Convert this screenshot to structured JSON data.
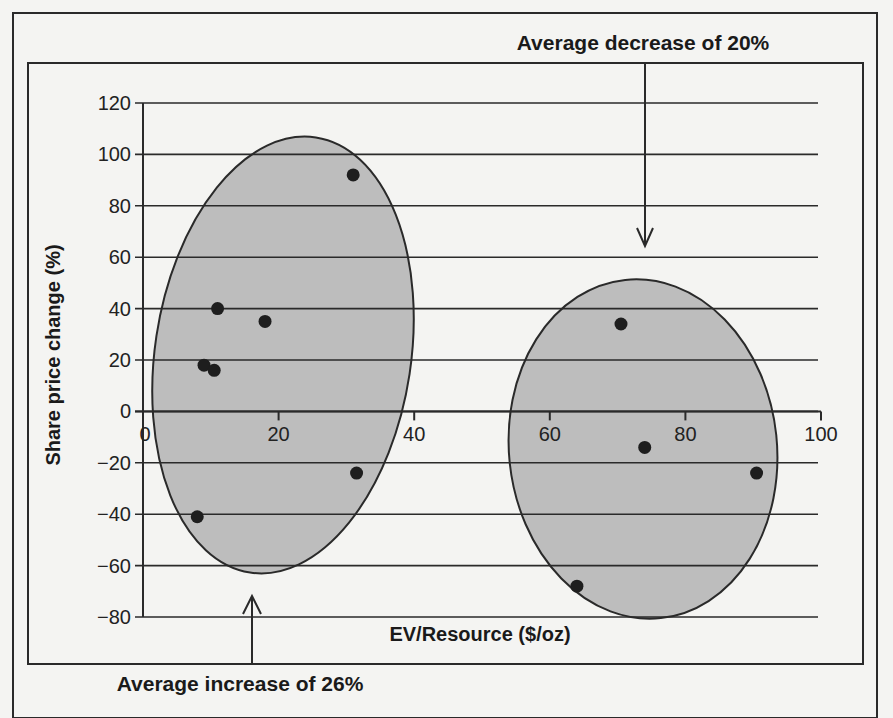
{
  "chart_data": {
    "type": "scatter",
    "title": "",
    "xlabel": "EV/Resource ($/oz)",
    "ylabel": "Share price change (%)",
    "xlim": [
      0,
      100
    ],
    "ylim": [
      -80,
      120
    ],
    "x_ticks": [
      0,
      20,
      40,
      60,
      80,
      100
    ],
    "y_ticks": [
      120,
      100,
      80,
      60,
      40,
      20,
      0,
      -20,
      -40,
      -60,
      -80
    ],
    "x_tick_labels": [
      "0",
      "20",
      "40",
      "60",
      "80",
      "100"
    ],
    "y_tick_labels": [
      "120",
      "100",
      "80",
      "60",
      "40",
      "20",
      "0",
      "−20",
      "−40",
      "−60",
      "−80"
    ],
    "grid": "horizontal",
    "legend": null,
    "series": [
      {
        "name": "Low EV/Resource group",
        "points": [
          {
            "x": 31,
            "y": 92
          },
          {
            "x": 11,
            "y": 40
          },
          {
            "x": 18,
            "y": 35
          },
          {
            "x": 9,
            "y": 18
          },
          {
            "x": 10.5,
            "y": 16
          },
          {
            "x": 31.5,
            "y": -24
          },
          {
            "x": 8,
            "y": -41
          }
        ]
      },
      {
        "name": "High EV/Resource group",
        "points": [
          {
            "x": 70.5,
            "y": 34
          },
          {
            "x": 74,
            "y": -14
          },
          {
            "x": 90.5,
            "y": -24
          },
          {
            "x": 64,
            "y": -68
          }
        ]
      }
    ],
    "annotations": [
      {
        "text": "Average increase of 26%",
        "target_group": "Low EV/Resource group",
        "arrow": "up"
      },
      {
        "text": "Average decrease of 20%",
        "target_group": "High EV/Resource group",
        "arrow": "down"
      }
    ],
    "clusters": [
      {
        "name": "Low EV/Resource group",
        "cx": 283,
        "cy": 355,
        "rx": 128,
        "ry": 220,
        "rotate": 8.6
      },
      {
        "name": "High EV/Resource group",
        "cx": 643,
        "cy": 449,
        "rx": 134,
        "ry": 170,
        "rotate": -6
      }
    ]
  },
  "layout": {
    "x0_px": 143,
    "x100_px": 821,
    "y120_px": 103,
    "ym80_px": 617,
    "grid_right_px": 818,
    "point_radius": 6.5,
    "colors": {
      "background": "#f4f4f2",
      "ellipse_fill": "#bdbdbd",
      "line": "#2a2a2a",
      "point": "#1e1e1e"
    }
  }
}
